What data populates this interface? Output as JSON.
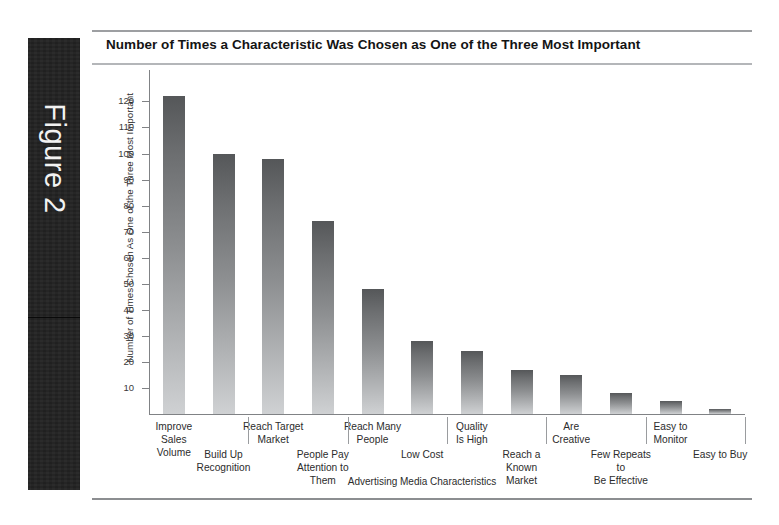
{
  "figure": {
    "label": "Figure 2"
  },
  "chart_title": "Number of Times a Characteristic Was Chosen as One of the Three Most Important",
  "chart_data": {
    "type": "bar",
    "title": "Number of Times a Characteristic Was Chosen as One of the Three Most Important",
    "xlabel": "Advertising Media Characteristics",
    "ylabel": "Number of Times Chosen As One of the Three Most Important",
    "categories": [
      "Improve Sales\nVolume",
      "Build Up\nRecognition",
      "Reach Target\nMarket",
      "People Pay\nAttention to Them",
      "Reach Many\nPeople",
      "Low Cost",
      "Quality\nIs High",
      "Reach a\nKnown Market",
      "Are\nCreative",
      "Few Repeats to\nBe Effective",
      "Easy to\nMonitor",
      "Easy to Buy"
    ],
    "values": [
      122,
      100,
      98,
      74,
      48,
      28,
      24,
      17,
      15,
      8,
      5,
      2
    ],
    "ylim": [
      0,
      125
    ],
    "yticks": [
      10,
      20,
      30,
      40,
      50,
      60,
      70,
      80,
      90,
      100,
      110,
      120
    ],
    "ytick_labels": [
      "10",
      "20",
      "30",
      "40",
      "50",
      "60",
      "70",
      "80",
      "90",
      "100",
      "110",
      "120"
    ],
    "grid": false,
    "legend": "none",
    "bar_gradient_top": "#555759",
    "bar_gradient_bottom": "#cfd1d3",
    "axis_color": "#808285"
  }
}
